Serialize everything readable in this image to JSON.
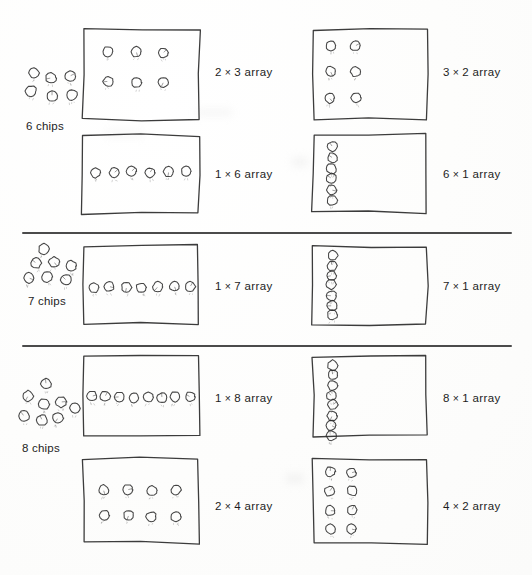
{
  "page": {
    "background_color": "#fdfdfd",
    "ink_color": "#2b2b2b",
    "width": 532,
    "height": 575
  },
  "sections": [
    {
      "id": "six",
      "chips_caption": "6 chips",
      "chip_count": 6,
      "cluster": {
        "x": 24,
        "y": 64,
        "w": 58,
        "h": 50,
        "positions": [
          [
            10,
            9
          ],
          [
            27,
            14
          ],
          [
            46,
            12
          ],
          [
            7,
            27
          ],
          [
            28,
            32
          ],
          [
            48,
            31
          ]
        ]
      },
      "cards": [
        {
          "id": "six-2x3",
          "label": "2 × 3 array",
          "rows": 2,
          "cols": 3,
          "box": {
            "x": 82,
            "y": 28,
            "w": 118,
            "h": 92
          },
          "grid": {
            "x": 26,
            "y": 24,
            "dx": 28,
            "dy": 30
          },
          "label_pos": {
            "x": 215,
            "y": 66
          }
        },
        {
          "id": "six-3x2",
          "label": "3 × 2 array",
          "rows": 3,
          "cols": 2,
          "box": {
            "x": 312,
            "y": 28,
            "w": 116,
            "h": 92
          },
          "grid": {
            "x": 18,
            "y": 18,
            "dx": 26,
            "dy": 26
          },
          "label_pos": {
            "x": 443,
            "y": 66
          }
        },
        {
          "id": "six-1x6",
          "label": "1 × 6 array",
          "rows": 1,
          "cols": 6,
          "box": {
            "x": 82,
            "y": 134,
            "w": 118,
            "h": 80
          },
          "grid": {
            "x": 14,
            "y": 38,
            "dx": 18,
            "dy": 0
          },
          "label_pos": {
            "x": 215,
            "y": 168
          }
        },
        {
          "id": "six-6x1",
          "label": "6 × 1 array",
          "rows": 6,
          "cols": 1,
          "box": {
            "x": 312,
            "y": 134,
            "w": 116,
            "h": 80
          },
          "grid": {
            "x": 20,
            "y": 12,
            "dx": 0,
            "dy": 11
          },
          "label_pos": {
            "x": 443,
            "y": 168
          }
        }
      ]
    },
    {
      "id": "seven",
      "chips_caption": "7 chips",
      "chip_count": 7,
      "cluster": {
        "x": 26,
        "y": 243,
        "w": 56,
        "h": 46,
        "positions": [
          [
            18,
            6
          ],
          [
            10,
            20
          ],
          [
            28,
            19
          ],
          [
            45,
            23
          ],
          [
            3,
            35
          ],
          [
            21,
            34
          ],
          [
            40,
            37
          ]
        ]
      },
      "cards": [
        {
          "id": "seven-1x7",
          "label": "1 × 7 array",
          "rows": 1,
          "cols": 7,
          "box": {
            "x": 82,
            "y": 245,
            "w": 118,
            "h": 80
          },
          "grid": {
            "x": 12,
            "y": 42,
            "dx": 16,
            "dy": 0
          },
          "label_pos": {
            "x": 215,
            "y": 280
          }
        },
        {
          "id": "seven-7x1",
          "label": "7 × 1 array",
          "rows": 7,
          "cols": 1,
          "box": {
            "x": 312,
            "y": 245,
            "w": 116,
            "h": 80
          },
          "grid": {
            "x": 20,
            "y": 10,
            "dx": 0,
            "dy": 10
          },
          "label_pos": {
            "x": 443,
            "y": 280
          }
        }
      ]
    },
    {
      "id": "eight",
      "chips_caption": "8 chips",
      "chip_count": 8,
      "cluster": {
        "x": 20,
        "y": 378,
        "w": 66,
        "h": 58,
        "positions": [
          [
            26,
            6
          ],
          [
            8,
            18
          ],
          [
            24,
            26
          ],
          [
            41,
            24
          ],
          [
            55,
            30
          ],
          [
            4,
            38
          ],
          [
            22,
            42
          ],
          [
            38,
            40
          ]
        ]
      },
      "cards": [
        {
          "id": "eight-1x8",
          "label": "1 × 8 array",
          "rows": 1,
          "cols": 8,
          "box": {
            "x": 82,
            "y": 355,
            "w": 118,
            "h": 82
          },
          "grid": {
            "x": 10,
            "y": 42,
            "dx": 14,
            "dy": 0
          },
          "label_pos": {
            "x": 215,
            "y": 392
          }
        },
        {
          "id": "eight-8x1",
          "label": "8 × 1 array",
          "rows": 8,
          "cols": 1,
          "box": {
            "x": 312,
            "y": 355,
            "w": 116,
            "h": 82
          },
          "grid": {
            "x": 20,
            "y": 10,
            "dx": 0,
            "dy": 10
          },
          "label_pos": {
            "x": 443,
            "y": 392
          }
        },
        {
          "id": "eight-2x4",
          "label": "2 × 4 array",
          "rows": 2,
          "cols": 4,
          "box": {
            "x": 82,
            "y": 458,
            "w": 118,
            "h": 86
          },
          "grid": {
            "x": 22,
            "y": 32,
            "dx": 24,
            "dy": 26
          },
          "label_pos": {
            "x": 215,
            "y": 500
          }
        },
        {
          "id": "eight-4x2",
          "label": "4 × 2 array",
          "rows": 4,
          "cols": 2,
          "box": {
            "x": 312,
            "y": 458,
            "w": 116,
            "h": 86
          },
          "grid": {
            "x": 18,
            "y": 14,
            "dx": 22,
            "dy": 19
          },
          "label_pos": {
            "x": 443,
            "y": 500
          }
        }
      ]
    }
  ],
  "dividers": [
    {
      "x": 22,
      "y": 232,
      "w": 490
    },
    {
      "x": 22,
      "y": 345,
      "w": 490
    }
  ],
  "smudges": [
    {
      "x": 292,
      "y": 158,
      "w": 16,
      "h": 8
    },
    {
      "x": 286,
      "y": 474,
      "w": 18,
      "h": 9
    },
    {
      "x": 196,
      "y": 110,
      "w": 36,
      "h": 5
    },
    {
      "x": 104,
      "y": 132,
      "w": 40,
      "h": 4
    }
  ]
}
